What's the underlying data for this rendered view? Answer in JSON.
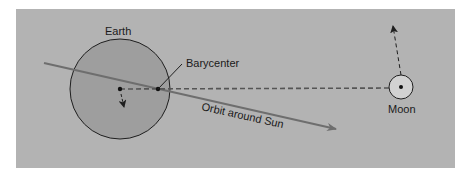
{
  "diagram": {
    "colors": {
      "page_background": "#ffffff",
      "panel_background": "#b3b3b3",
      "earth_fill": "#9e9e9e",
      "moon_fill": "#d2d2d2",
      "stroke": "#1f1f1f",
      "orbit_line": "#6e6e6e",
      "dashed_line": "#555555"
    },
    "labels": {
      "earth": "Earth",
      "barycenter": "Barycenter",
      "orbit": "Orbit around Sun",
      "moon": "Moon"
    },
    "nodes": [
      {
        "id": "earth",
        "label": "Earth",
        "shape": "circle",
        "cx": 120,
        "cy": 89,
        "r": 50
      },
      {
        "id": "barycenter",
        "label": "Barycenter",
        "shape": "dot",
        "cx": 158,
        "cy": 89
      },
      {
        "id": "moon",
        "label": "Moon",
        "shape": "circle",
        "cx": 401,
        "cy": 87,
        "r": 12
      }
    ],
    "edges": [
      {
        "from": "earth",
        "to": "moon",
        "style": "dashed",
        "meaning": "Earth-Moon separation line through barycenter"
      },
      {
        "from": "barycenter",
        "to": "sun-orbit",
        "style": "solid-arrow",
        "label": "Orbit around Sun"
      },
      {
        "from": "moon",
        "to": "moon-motion",
        "style": "dashed-arrow",
        "meaning": "Moon orbital motion"
      },
      {
        "from": "earth",
        "to": "earth-motion",
        "style": "dashed-arrow",
        "meaning": "Earth wobble around barycenter"
      }
    ]
  }
}
